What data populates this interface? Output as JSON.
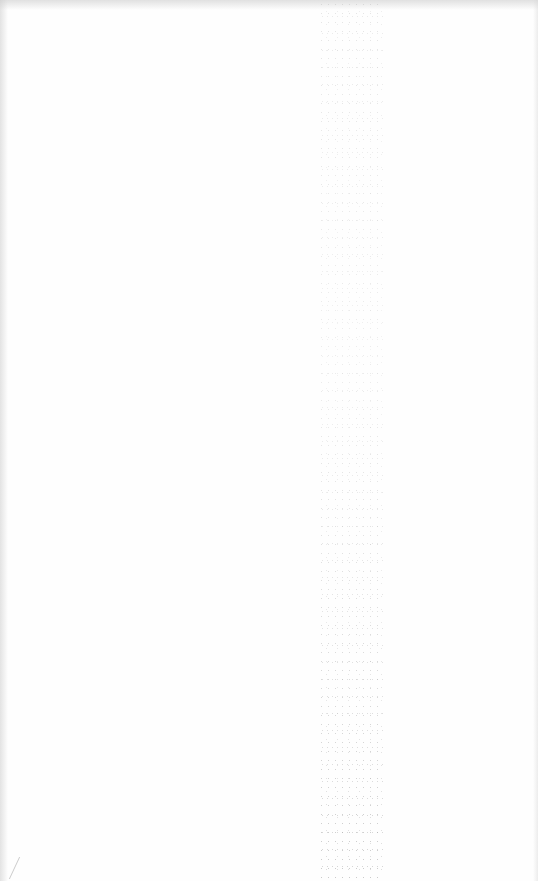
{
  "page": {
    "type": "blank-scanned-page",
    "background_color": "#fefefe",
    "noise_color": "#8c8c8c",
    "text_content": ""
  }
}
